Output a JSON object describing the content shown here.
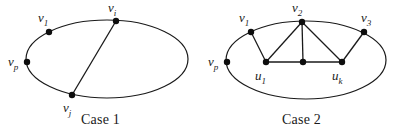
{
  "figure": {
    "background_color": "#ffffff",
    "stroke_color": "#1a1a1a",
    "vertex_color": "#0d0d0d",
    "panels": [
      {
        "id": "case1",
        "caption": "Case 1",
        "ellipse": {
          "cx": 107,
          "cy": 59,
          "rx": 81,
          "ry": 39
        },
        "vertices": [
          {
            "id": "v1",
            "label_base": "v",
            "label_sub": "1",
            "x": 49,
            "y": 32,
            "label_x": 38,
            "label_y": 22
          },
          {
            "id": "vi",
            "label_base": "v",
            "label_sub": "i",
            "x": 116,
            "y": 21,
            "label_x": 108,
            "label_y": 12
          },
          {
            "id": "vp",
            "label_base": "v",
            "label_sub": "p",
            "x": 27,
            "y": 62,
            "label_x": 8,
            "label_y": 66
          },
          {
            "id": "vj",
            "label_base": "v",
            "label_sub": "j",
            "x": 72,
            "y": 95,
            "label_x": 63,
            "label_y": 112
          }
        ],
        "edges": [
          {
            "from": "vi",
            "to": "vj"
          }
        ]
      },
      {
        "id": "case2",
        "caption": "Case 2",
        "ellipse": {
          "cx": 108,
          "cy": 60,
          "rx": 80,
          "ry": 39
        },
        "vertices": [
          {
            "id": "v1",
            "label_base": "v",
            "label_sub": "1",
            "x": 53,
            "y": 32,
            "label_x": 41,
            "label_y": 22
          },
          {
            "id": "v2",
            "label_base": "v",
            "label_sub": "2",
            "x": 104,
            "y": 22,
            "label_x": 94,
            "label_y": 12
          },
          {
            "id": "v3",
            "label_base": "v",
            "label_sub": "3",
            "x": 166,
            "y": 32,
            "label_x": 163,
            "label_y": 22
          },
          {
            "id": "vp",
            "label_base": "v",
            "label_sub": "p",
            "x": 29,
            "y": 62,
            "label_x": 10,
            "label_y": 66
          },
          {
            "id": "u1",
            "label_base": "u",
            "label_sub": "1",
            "x": 68,
            "y": 62,
            "label_x": 57,
            "label_y": 80
          },
          {
            "id": "um",
            "label_base": "",
            "label_sub": "",
            "x": 105,
            "y": 62,
            "label_x": 0,
            "label_y": 0
          },
          {
            "id": "uk",
            "label_base": "u",
            "label_sub": "k",
            "x": 144,
            "y": 62,
            "label_x": 134,
            "label_y": 80
          }
        ],
        "edges": [
          {
            "from": "v1",
            "to": "u1"
          },
          {
            "from": "v2",
            "to": "u1"
          },
          {
            "from": "v2",
            "to": "um"
          },
          {
            "from": "v2",
            "to": "uk"
          },
          {
            "from": "v3",
            "to": "uk"
          },
          {
            "from": "u1",
            "to": "um"
          },
          {
            "from": "um",
            "to": "uk"
          }
        ]
      }
    ]
  }
}
